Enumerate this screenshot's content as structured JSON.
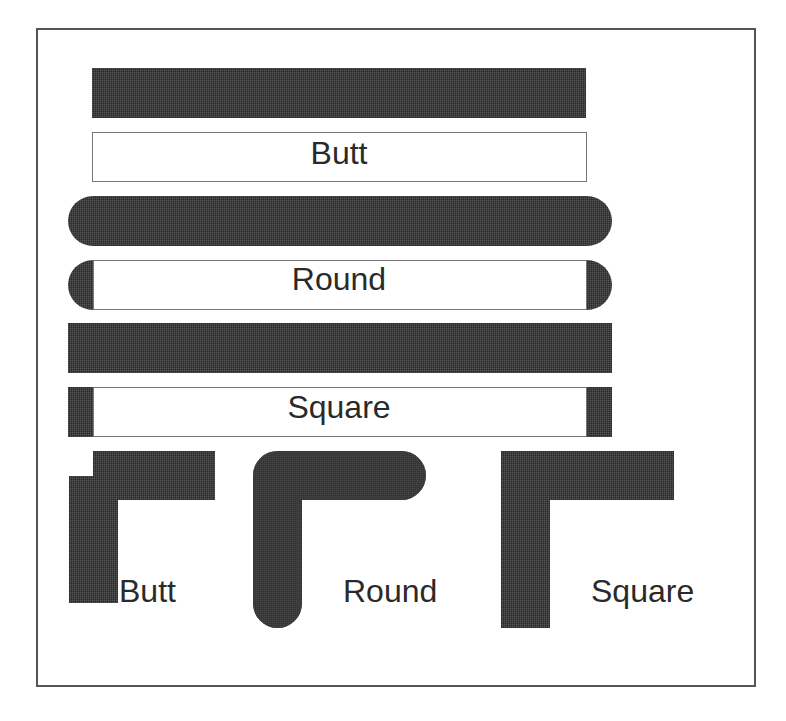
{
  "diagram": {
    "stroke_color": "#3b3b3b",
    "outline_color": "#777777",
    "frame_color": "#555555",
    "caps": [
      {
        "name": "butt",
        "label": "Butt"
      },
      {
        "name": "round",
        "label": "Round"
      },
      {
        "name": "square",
        "label": "Square"
      }
    ],
    "corners": [
      {
        "name": "butt",
        "label": "Butt"
      },
      {
        "name": "round",
        "label": "Round"
      },
      {
        "name": "square",
        "label": "Square"
      }
    ]
  }
}
